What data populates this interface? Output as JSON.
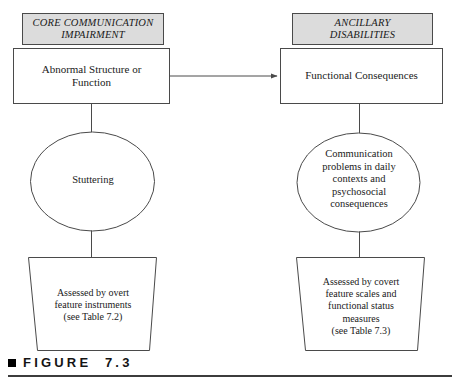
{
  "figure": {
    "caption_bullet": "square-bullet",
    "caption_text": "FIGURE  7.3",
    "rule": "horizontal-rule"
  },
  "colors": {
    "header_fill": "#dcdcdc",
    "shape_stroke": "#4a4a4a",
    "shape_fill": "#ffffff",
    "text": "#1a1a1a",
    "rule": "#3c3c3c",
    "page_background": "#ffffff"
  },
  "columns": [
    {
      "id": "core-communication-impairment",
      "header": "CORE COMMUNICATION\nIMPAIRMENT",
      "box": "Abnormal Structure or\nFunction",
      "ellipse": "Stuttering",
      "trapezoid": "Assessed by overt\nfeature instruments\n(see Table 7.2)"
    },
    {
      "id": "ancillary-disabilities",
      "header": "ANCILLARY\nDISABILITIES",
      "box": "Functional Consequences",
      "ellipse": "Communication\nproblems in daily\ncontexts and\npsychosocial\nconsequences",
      "trapezoid": "Assessed by covert\nfeature scales and\nfunctional status\nmeasures\n(see Table 7.3)"
    }
  ],
  "connectors": [
    {
      "id": "impairment-to-consequences",
      "type": "arrow",
      "from": "Abnormal Structure or Function",
      "to": "Functional Consequences",
      "direction": "right"
    },
    {
      "id": "left-box-to-ellipse",
      "type": "line",
      "from": "Abnormal Structure or Function",
      "to": "Stuttering"
    },
    {
      "id": "left-ellipse-to-trapezoid",
      "type": "line",
      "from": "Stuttering",
      "to": "Assessed by overt feature instruments"
    },
    {
      "id": "right-box-to-ellipse",
      "type": "line",
      "from": "Functional Consequences",
      "to": "Communication problems in daily contexts and psychosocial consequences"
    },
    {
      "id": "right-ellipse-to-trapezoid",
      "type": "line",
      "from": "Communication problems in daily contexts and psychosocial consequences",
      "to": "Assessed by covert feature scales and functional status measures"
    }
  ]
}
